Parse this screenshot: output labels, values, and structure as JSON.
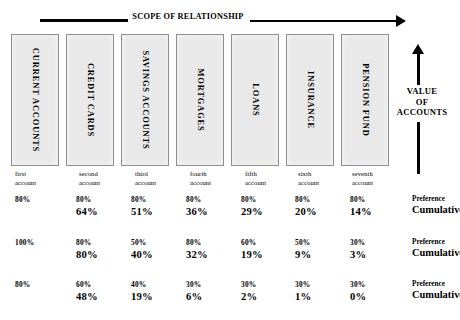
{
  "header": {
    "scope_label": "SCOPE OF RELATIONSHIP"
  },
  "value_axis": {
    "line1": "VALUE",
    "line2": "OF",
    "line3": "ACCOUNTS"
  },
  "products": [
    {
      "label": "CURRENT ACCOUNTS",
      "x": 11,
      "w": 48
    },
    {
      "label": "CREDIT CARDS",
      "x": 66,
      "w": 48
    },
    {
      "label": "SAVINGS ACCOUNTS",
      "x": 121,
      "w": 48
    },
    {
      "label": "MORTGAGES",
      "x": 176,
      "w": 48
    },
    {
      "label": "LOANS",
      "x": 231,
      "w": 48
    },
    {
      "label": "INSURANCE",
      "x": 286,
      "w": 48
    },
    {
      "label": "PENSION FUND",
      "x": 341,
      "w": 48
    }
  ],
  "account_labels": [
    {
      "line1": "first",
      "line2": "account",
      "x": 15
    },
    {
      "line1": "second",
      "line2": "account",
      "x": 79
    },
    {
      "line1": "third",
      "line2": "account",
      "x": 135
    },
    {
      "line1": "fourth",
      "line2": "account",
      "x": 190
    },
    {
      "line1": "fifth",
      "line2": "account",
      "x": 245
    },
    {
      "line1": "sixth",
      "line2": "account",
      "x": 298
    },
    {
      "line1": "seventh",
      "line2": "account",
      "x": 352
    }
  ],
  "row_label_preference": "Preference",
  "row_label_cumulative": "Cumulative",
  "chart_data": {
    "type": "table",
    "title": "SCOPE OF RELATIONSHIP",
    "xlabel": "SCOPE OF RELATIONSHIP",
    "ylabel": "VALUE OF ACCOUNTS",
    "categories": [
      "CURRENT ACCOUNTS",
      "CREDIT CARDS",
      "SAVINGS ACCOUNTS",
      "MORTGAGES",
      "LOANS",
      "INSURANCE",
      "PENSION FUND"
    ],
    "account_order": [
      "first account",
      "second account",
      "third account",
      "fourth account",
      "fifth account",
      "sixth account",
      "seventh account"
    ],
    "row_series": [
      "Preference",
      "Cumulative"
    ],
    "rows": [
      {
        "preference": [
          "80%",
          "80%",
          "80%",
          "80%",
          "80%",
          "80%",
          "80%"
        ],
        "cumulative": [
          "",
          "64%",
          "51%",
          "36%",
          "29%",
          "20%",
          "14%"
        ]
      },
      {
        "preference": [
          "100%",
          "80%",
          "50%",
          "80%",
          "60%",
          "50%",
          "30%"
        ],
        "cumulative": [
          "",
          "80%",
          "40%",
          "32%",
          "19%",
          "9%",
          "3%"
        ]
      },
      {
        "preference": [
          "80%",
          "60%",
          "40%",
          "30%",
          "30%",
          "30%",
          "30%"
        ],
        "cumulative": [
          "",
          "48%",
          "19%",
          "6%",
          "2%",
          "1%",
          "0%"
        ]
      }
    ]
  },
  "colors": {
    "box_fill": "#e9e9e9",
    "box_border": "#8f8f8f",
    "ink": "#000000",
    "background": "#ffffff"
  }
}
